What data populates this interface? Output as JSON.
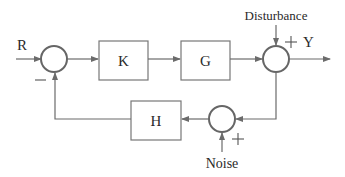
{
  "diagram": {
    "type": "feedback control block diagram",
    "signals": {
      "input": "R",
      "output": "Y",
      "disturbance": "Disturbance",
      "noise": "Noise"
    },
    "blocks": [
      {
        "id": "K",
        "label": "K"
      },
      {
        "id": "G",
        "label": "G"
      },
      {
        "id": "H",
        "label": "H"
      }
    ],
    "junctions": [
      {
        "id": "sum1",
        "signs": [
          "+ (R)",
          "- (feedback)"
        ],
        "minus_label": "—"
      },
      {
        "id": "sum2",
        "signs": [
          "+ (G output)",
          "+ (Disturbance)"
        ],
        "plus_label": "+"
      },
      {
        "id": "sum3",
        "signs": [
          "+ (Y)",
          "+ (Noise)"
        ],
        "plus_label": "+"
      }
    ],
    "edges": [
      "R -> sum1",
      "sum1 -> K",
      "K -> G",
      "G -> sum2",
      "Disturbance -> sum2",
      "sum2 -> Y",
      "sum2 -> sum3",
      "Noise -> sum3",
      "sum3 -> H",
      "H -> sum1 (negative)"
    ]
  }
}
